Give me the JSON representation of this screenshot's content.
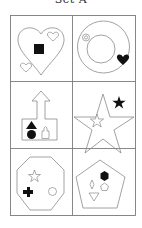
{
  "title": "Set A",
  "colors": {
    "background": "#ffffff",
    "outline": "#8a8a8a",
    "fill": "#111111",
    "grid": "#7a7a7a"
  },
  "cells": [
    {
      "row": 1,
      "col": 1,
      "outer": "heart",
      "inner": [
        "solid-square",
        "hollow-heart-small",
        "hollow-heart-small"
      ]
    },
    {
      "row": 1,
      "col": 2,
      "outer": "ring",
      "inner": [
        "hollow-circle-small",
        "solid-heart"
      ]
    },
    {
      "row": 2,
      "col": 1,
      "outer": "arrow-house",
      "inner": [
        "solid-triangle",
        "solid-circle",
        "hollow-house-small"
      ]
    },
    {
      "row": 2,
      "col": 2,
      "outer": "star",
      "inner": [
        "solid-star",
        "hollow-star-small"
      ]
    },
    {
      "row": 3,
      "col": 1,
      "outer": "octagon",
      "inner": [
        "hollow-star",
        "solid-cross",
        "hollow-circle"
      ]
    },
    {
      "row": 3,
      "col": 2,
      "outer": "pentagon",
      "inner": [
        "solid-hexagon",
        "hollow-diamond",
        "hollow-pentagon",
        "hollow-triangle-down"
      ]
    }
  ]
}
